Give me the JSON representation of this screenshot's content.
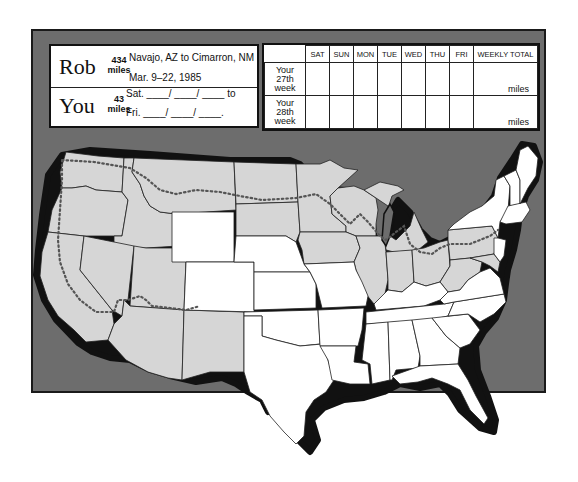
{
  "runner": {
    "name": "Rob",
    "miles_value": "434",
    "miles_unit": "miles",
    "route": "Navajo, AZ to Cimarron, NM",
    "dates": "Mar. 9–22, 1985"
  },
  "you": {
    "name": "You",
    "miles_value": "43",
    "miles_unit": "miles",
    "start_line": "Sat. ____/ ____/ ____ to",
    "end_line": "Fri. ____/ ____/ ____."
  },
  "log_table": {
    "columns": [
      "SAT",
      "SUN",
      "MON",
      "TUE",
      "WED",
      "THU",
      "FRI",
      "WEEKLY TOTAL"
    ],
    "rows": [
      {
        "label": [
          "Your",
          "27th",
          "week"
        ],
        "total_unit": "miles"
      },
      {
        "label": [
          "Your",
          "28th",
          "week"
        ],
        "total_unit": "miles"
      }
    ]
  },
  "map": {
    "colors": {
      "background": "#6d6d6d",
      "completed_states": "#d6d6d6",
      "other_states": "#ffffff",
      "coast_shadow": "#111111",
      "route_dots": "#555555"
    },
    "legend_meaning": {
      "shaded": "states traversed",
      "dotted_line": "route"
    }
  }
}
